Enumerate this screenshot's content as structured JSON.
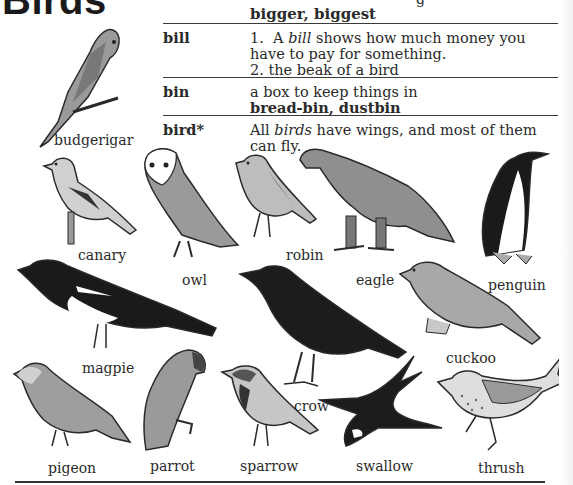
{
  "page": {
    "title": "Birds",
    "partial_top_text": "g",
    "continuation": "bigger, biggest"
  },
  "entries": [
    {
      "headword": "bill",
      "definition_parts": {
        "line1_num": "1.",
        "line1_a": "A ",
        "line1_italic": "bill",
        "line1_b": " shows how much money you have to pay for something.",
        "line2": "2.  the beak of a bird"
      }
    },
    {
      "headword": "bin",
      "definition_parts": {
        "line1": "a box to keep things in",
        "examples": "bread-bin, dustbin"
      }
    },
    {
      "headword": "bird*",
      "definition_parts": {
        "line1_a": "All ",
        "line1_italic": "birds",
        "line1_b": " have wings, and most of them can fly."
      }
    }
  ],
  "birds": [
    {
      "name": "budgerigar"
    },
    {
      "name": "canary"
    },
    {
      "name": "owl"
    },
    {
      "name": "robin"
    },
    {
      "name": "eagle"
    },
    {
      "name": "penguin"
    },
    {
      "name": "magpie"
    },
    {
      "name": "cuckoo"
    },
    {
      "name": "crow"
    },
    {
      "name": "pigeon"
    },
    {
      "name": "parrot"
    },
    {
      "name": "sparrow"
    },
    {
      "name": "swallow"
    },
    {
      "name": "thrush"
    }
  ],
  "colors": {
    "ink": "#2a2a2a",
    "gray_fill": "#9a9a9a",
    "light_fill": "#d0d0d0",
    "black_fill": "#1a1a1a"
  }
}
